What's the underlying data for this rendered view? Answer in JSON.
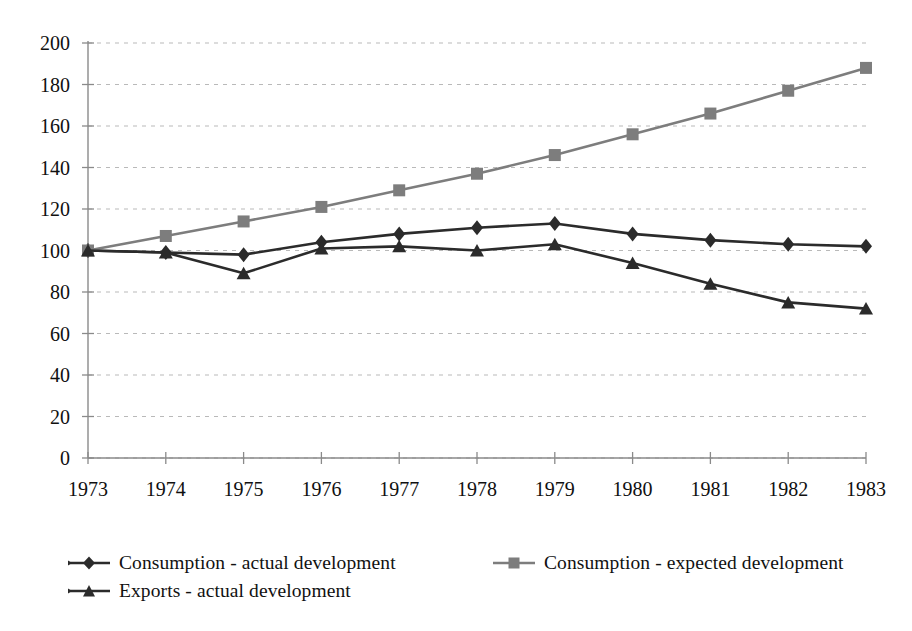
{
  "chart_data": {
    "type": "line",
    "title": "",
    "subtitle": "",
    "xlabel": "",
    "ylabel": "",
    "categories": [
      "1973",
      "1974",
      "1975",
      "1976",
      "1977",
      "1978",
      "1979",
      "1980",
      "1981",
      "1982",
      "1983"
    ],
    "ylim": [
      0,
      200
    ],
    "ytick_values": [
      0,
      20,
      40,
      60,
      80,
      100,
      120,
      140,
      160,
      180,
      200
    ],
    "ytick_labels": [
      "0",
      "20",
      "40",
      "60",
      "80",
      "100",
      "120",
      "140",
      "160",
      "180",
      "200"
    ],
    "grid": true,
    "grid_style": "dotted-horizontal",
    "legend_position": "bottom-left",
    "series": [
      {
        "name": "Consumption - actual development",
        "marker": "diamond",
        "color": "#2b2b2b",
        "values": [
          100,
          99,
          98,
          104,
          108,
          111,
          113,
          108,
          105,
          103,
          102
        ]
      },
      {
        "name": "Consumption - expected development",
        "marker": "square",
        "color": "#7d7d7d",
        "values": [
          100,
          107,
          114,
          121,
          129,
          137,
          146,
          156,
          166,
          177,
          188
        ]
      },
      {
        "name": "Exports - actual development",
        "marker": "triangle",
        "color": "#2b2b2b",
        "values": [
          100,
          99,
          89,
          101,
          102,
          100,
          103,
          94,
          84,
          75,
          72
        ]
      }
    ]
  },
  "legend": {
    "items": [
      {
        "label": "Consumption - actual development",
        "marker": "diamond-marker-icon",
        "color": "#2b2b2b"
      },
      {
        "label": "Consumption - expected development",
        "marker": "square-marker-icon",
        "color": "#7d7d7d"
      },
      {
        "label": "Exports - actual development",
        "marker": "triangle-marker-icon",
        "color": "#2b2b2b"
      }
    ]
  },
  "axes": {
    "y_axis_color": "#8a8a8a",
    "x_axis_color": "#8a8a8a",
    "gridline_color": "#b9b9b9"
  }
}
